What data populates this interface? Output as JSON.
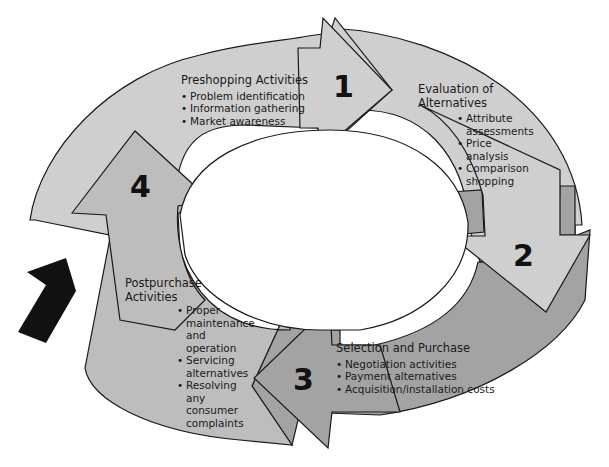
{
  "diagram": {
    "type": "cycle",
    "colors": {
      "light_fill": "#cfcfcf",
      "mid_fill": "#b4b4b4",
      "dark_fill": "#9a9a9a",
      "stroke": "#1a1a1a",
      "entry_arrow": "#111111",
      "background": "#ffffff"
    },
    "stages": [
      {
        "number": "1",
        "title": "Preshopping Activities",
        "items": [
          "Problem identification",
          "Information gathering",
          "Market awareness"
        ]
      },
      {
        "number": "2",
        "title": "Evaluation of Alternatives",
        "title_lines": [
          "Evaluation of",
          "Alternatives"
        ],
        "items": [
          "Attribute assessments",
          "Price analysis",
          "Comparison shopping"
        ]
      },
      {
        "number": "3",
        "title": "Selection and Purchase",
        "items": [
          "Negotiation activities",
          "Payment alternatives",
          "Acquisition/installation costs"
        ]
      },
      {
        "number": "4",
        "title": "Postpurchase Activities",
        "title_lines": [
          "Postpurchase",
          "Activities"
        ],
        "items": [
          "Proper maintenance and operation",
          "Servicing alternatives",
          "Resolving any consumer complaints"
        ]
      }
    ],
    "entry_arrow": "entry-arrow"
  }
}
